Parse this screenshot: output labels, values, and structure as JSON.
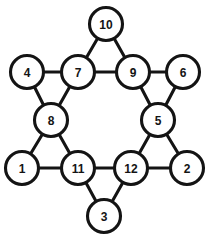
{
  "figure": {
    "type": "node-link-diagram",
    "width": 209,
    "height": 240,
    "background_color": "#ffffff",
    "stroke_color": "#141414",
    "node_fill_color": "#ffffff",
    "edge_stroke_width": 3.1,
    "node_stroke_width": 3.1
  },
  "nodes": [
    {
      "id": "10",
      "label": "10",
      "cx": 106,
      "cy": 24,
      "r": 16.5,
      "role": "outer-point-top"
    },
    {
      "id": "4",
      "label": "4",
      "cx": 27,
      "cy": 72,
      "r": 16.5,
      "role": "outer-point-upper-left"
    },
    {
      "id": "7",
      "label": "7",
      "cx": 78,
      "cy": 72,
      "r": 16.5,
      "role": "inner-hexagon"
    },
    {
      "id": "9",
      "label": "9",
      "cx": 133,
      "cy": 72,
      "r": 16.5,
      "role": "inner-hexagon"
    },
    {
      "id": "6",
      "label": "6",
      "cx": 183,
      "cy": 72,
      "r": 16.5,
      "role": "outer-point-upper-right"
    },
    {
      "id": "8",
      "label": "8",
      "cx": 51,
      "cy": 120,
      "r": 16.5,
      "role": "inner-hexagon"
    },
    {
      "id": "5",
      "label": "5",
      "cx": 158,
      "cy": 120,
      "r": 16.5,
      "role": "inner-hexagon"
    },
    {
      "id": "1",
      "label": "1",
      "cx": 22,
      "cy": 168,
      "r": 16.5,
      "role": "outer-point-lower-left"
    },
    {
      "id": "11",
      "label": "11",
      "cx": 78,
      "cy": 168,
      "r": 16.5,
      "role": "inner-hexagon"
    },
    {
      "id": "12",
      "label": "12",
      "cx": 131,
      "cy": 168,
      "r": 16.5,
      "role": "inner-hexagon"
    },
    {
      "id": "2",
      "label": "2",
      "cx": 187,
      "cy": 168,
      "r": 16.5,
      "role": "outer-point-lower-right"
    },
    {
      "id": "3",
      "label": "3",
      "cx": 104,
      "cy": 216,
      "r": 16.5,
      "role": "outer-point-bottom"
    }
  ],
  "edges": [
    {
      "from": "10",
      "to": "7",
      "name": "edge-10-7"
    },
    {
      "from": "10",
      "to": "9",
      "name": "edge-10-9"
    },
    {
      "from": "7",
      "to": "9",
      "name": "edge-7-9"
    },
    {
      "from": "4",
      "to": "7",
      "name": "edge-4-7"
    },
    {
      "from": "4",
      "to": "8",
      "name": "edge-4-8"
    },
    {
      "from": "7",
      "to": "8",
      "name": "edge-7-8"
    },
    {
      "from": "9",
      "to": "6",
      "name": "edge-9-6"
    },
    {
      "from": "9",
      "to": "5",
      "name": "edge-9-5"
    },
    {
      "from": "6",
      "to": "5",
      "name": "edge-6-5"
    },
    {
      "from": "8",
      "to": "1",
      "name": "edge-8-1"
    },
    {
      "from": "8",
      "to": "11",
      "name": "edge-8-11"
    },
    {
      "from": "1",
      "to": "11",
      "name": "edge-1-11"
    },
    {
      "from": "5",
      "to": "12",
      "name": "edge-5-12"
    },
    {
      "from": "5",
      "to": "2",
      "name": "edge-5-2"
    },
    {
      "from": "12",
      "to": "2",
      "name": "edge-12-2"
    },
    {
      "from": "11",
      "to": "12",
      "name": "edge-11-12"
    },
    {
      "from": "11",
      "to": "3",
      "name": "edge-11-3"
    },
    {
      "from": "12",
      "to": "3",
      "name": "edge-12-3"
    }
  ]
}
